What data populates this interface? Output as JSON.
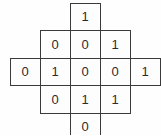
{
  "figure": {
    "type": "binary-diamond-grid",
    "shape": "diamond",
    "rows": 5,
    "columns": 5,
    "background_color": "#fefefe",
    "border_color": "#3a3a3a",
    "text_color": "#2b2b2b"
  },
  "chart_data": {
    "type": "table",
    "title": "",
    "xlabel": "",
    "ylabel": "",
    "note": "Diamond-shaped arrangement of binary cells; blank positions are absent (no cell drawn).",
    "rows": [
      {
        "label": "row-1",
        "cells": [
          null,
          null,
          "1",
          null,
          null
        ]
      },
      {
        "label": "row-2",
        "cells": [
          null,
          "0",
          "0",
          "1",
          null
        ]
      },
      {
        "label": "row-3",
        "cells": [
          "0",
          "1",
          "0",
          "0",
          "1"
        ]
      },
      {
        "label": "row-4",
        "cells": [
          null,
          "0",
          "1",
          "1",
          null
        ]
      },
      {
        "label": "row-5",
        "cells": [
          null,
          null,
          "0",
          null,
          null
        ]
      }
    ]
  },
  "cells": {
    "r1c3": "1",
    "r2c2": "0",
    "r2c3": "0",
    "r2c4": "1",
    "r3c1": "0",
    "r3c2": "1",
    "r3c3": "0",
    "r3c4": "0",
    "r3c5": "1",
    "r4c2": "0",
    "r4c3": "1",
    "r4c4": "1",
    "r5c3": "0"
  }
}
